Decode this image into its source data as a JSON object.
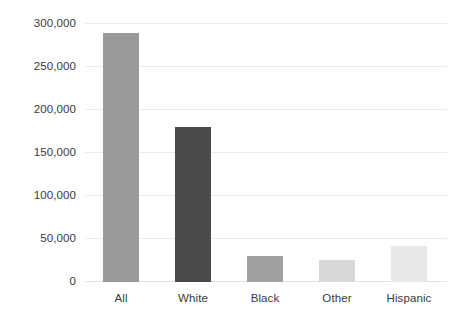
{
  "chart_data": {
    "type": "bar",
    "title": "",
    "subtitle": "",
    "xlabel": "",
    "ylabel": "",
    "categories": [
      "All",
      "White",
      "Black",
      "Other",
      "Hispanic"
    ],
    "values": [
      289000,
      180000,
      30000,
      26000,
      42000
    ],
    "series": [
      {
        "name": "Count",
        "values": [
          289000,
          180000,
          30000,
          26000,
          42000
        ]
      }
    ],
    "bar_colors": [
      "#9a9a9a",
      "#4a4a4a",
      "#a0a0a0",
      "#d8d8d8",
      "#e8e8e8"
    ],
    "ylim": [
      0,
      300000
    ],
    "ytick_values": [
      0,
      50000,
      100000,
      150000,
      200000,
      250000,
      300000
    ],
    "ytick_labels": [
      "0",
      "50,000",
      "100,000",
      "150,000",
      "200,000",
      "250,000",
      "300,000"
    ],
    "grid": true,
    "grid_color": "#ececec",
    "legend": false,
    "legend_position": "none",
    "text_color": "#3a3a3a",
    "background": "#ffffff"
  }
}
